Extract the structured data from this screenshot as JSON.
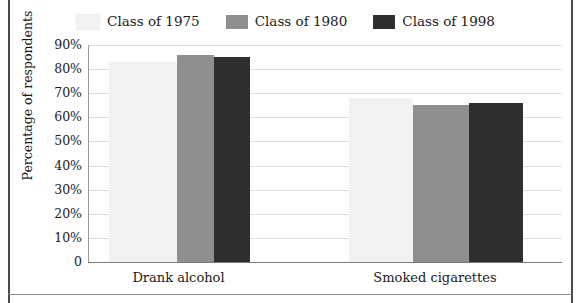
{
  "chart_data": {
    "type": "bar",
    "title": "",
    "xlabel": "",
    "ylabel": "Percentage of respondents",
    "ylim": [
      0,
      90
    ],
    "grid": true,
    "legend_position": "top-center",
    "categories": [
      "Drank alcohol",
      "Smoked cigarettes"
    ],
    "ytick_labels": [
      "90%",
      "80%",
      "70%",
      "60%",
      "50%",
      "40%",
      "30%",
      "20%",
      "10%",
      "0"
    ],
    "ytick_values": [
      90,
      80,
      70,
      60,
      50,
      40,
      30,
      20,
      10,
      0
    ],
    "series": [
      {
        "name": "Class of 1975",
        "color": "#f2f2f0",
        "values": [
          83,
          68
        ]
      },
      {
        "name": "Class of 1980",
        "color": "#8f8f8f",
        "values": [
          86,
          65
        ]
      },
      {
        "name": "Class of 1998",
        "color": "#2e2e2e",
        "values": [
          85,
          66
        ]
      }
    ]
  },
  "legend": {
    "items": [
      {
        "label": "Class of 1975",
        "swatch_name": "legend-swatch-class-of-1975"
      },
      {
        "label": "Class of 1980",
        "swatch_name": "legend-swatch-class-of-1980"
      },
      {
        "label": "Class of 1998",
        "swatch_name": "legend-swatch-class-of-1998"
      }
    ]
  },
  "axes": {
    "y_title": "Percentage of respondents"
  },
  "colors": {
    "frame": "#4a4a4a",
    "gridline": "#dcdcdc",
    "axis": "#7a7a7a",
    "text": "#1a1a1a",
    "background": "#ffffff"
  }
}
